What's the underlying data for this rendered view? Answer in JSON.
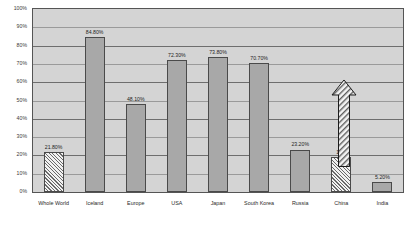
{
  "chart_data": {
    "type": "bar",
    "title": "",
    "xlabel": "",
    "ylabel": "",
    "ylim": [
      0,
      100
    ],
    "y_tick_labels": [
      "100%",
      "90%",
      "80%",
      "70%",
      "60%",
      "50%",
      "40%",
      "30%",
      "20%",
      "10%",
      "0%"
    ],
    "y_tick_values": [
      100,
      90,
      80,
      70,
      60,
      50,
      40,
      30,
      20,
      10,
      0
    ],
    "grid": true,
    "legend": "none",
    "categories": [
      "Whole World",
      "Iceland",
      "Europe",
      "USA",
      "Japan",
      "South Korea",
      "Russia",
      "China",
      "India"
    ],
    "values": [
      21.8,
      84.8,
      48.1,
      72.3,
      73.8,
      70.7,
      23.2,
      19.1,
      5.2
    ],
    "value_labels": [
      "21.80%",
      "84.80%",
      "48.10%",
      "72.30%",
      "73.80%",
      "70.70%",
      "23.20%",
      "19.1",
      "5.20%"
    ],
    "bar_styles": [
      "hatch",
      "solid",
      "solid",
      "solid",
      "solid",
      "solid",
      "solid",
      "hatch",
      "solid"
    ],
    "annotations": [
      {
        "name": "growth-arrow",
        "target_category": "China",
        "direction": "up",
        "style": "hatched-outline-arrow",
        "from_value": 19.1,
        "to_value": 62
      }
    ]
  },
  "colors": {
    "plot_background": "#d4d4d4",
    "bar_solid": "#a8a8a8",
    "bar_hatch_background": "#f2f2f2",
    "bar_outline": "#4a4a4a",
    "gridline": "#6e6e6e",
    "frame": "#555555",
    "text": "#2a2a2a"
  }
}
